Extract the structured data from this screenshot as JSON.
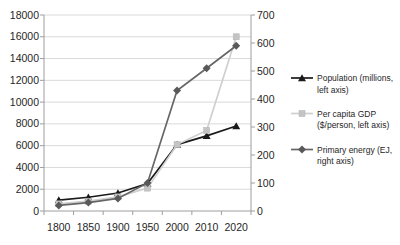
{
  "chart_data": {
    "type": "line",
    "title": "",
    "xlabel": "",
    "ylabel": "",
    "grid": true,
    "legend_position": "right",
    "categories": [
      "1800",
      "1850",
      "1900",
      "1950",
      "2000",
      "2010",
      "2020"
    ],
    "series": [
      {
        "name": "Population (millions, left axis)",
        "legend_lines": [
          "Population (millions,",
          "left axis)"
        ],
        "axis": "left",
        "marker": "triangle",
        "color": "#1a1a1a",
        "marker_color": "#1a1a1a",
        "values": [
          1000,
          1260,
          1650,
          2520,
          6100,
          6900,
          7800
        ]
      },
      {
        "name": "Per capita GDP ($/person, left axis)",
        "legend_lines": [
          "Per capita GDP",
          "($/person, left axis)"
        ],
        "axis": "left",
        "marker": "square",
        "color": "#cfcfcf",
        "marker_color": "#c4c4c4",
        "values": [
          660,
          900,
          1300,
          2100,
          6100,
          7400,
          16000
        ]
      },
      {
        "name": "Primary energy (EJ, right axis)",
        "legend_lines": [
          "Primary energy (EJ,",
          "right axis)"
        ],
        "axis": "right",
        "marker": "diamond",
        "color": "#666666",
        "marker_color": "#595959",
        "values": [
          20,
          30,
          45,
          100,
          430,
          510,
          590
        ]
      }
    ],
    "left_axis": {
      "min": 0,
      "max": 18000,
      "step": 2000,
      "tick_labels": [
        "0",
        "2000",
        "4000",
        "6000",
        "8000",
        "10000",
        "12000",
        "14000",
        "16000",
        "18000"
      ]
    },
    "right_axis": {
      "min": 0,
      "max": 700,
      "step": 100,
      "tick_labels": [
        "0",
        "100",
        "200",
        "300",
        "400",
        "500",
        "600",
        "700"
      ]
    }
  },
  "colors": {
    "background": "#ffffff",
    "gridline": "#d9d9d9",
    "axis_line": "#9e9e9e",
    "tick": "#9e9e9e",
    "axis_text": "#262626",
    "legend_text": "#262626"
  }
}
